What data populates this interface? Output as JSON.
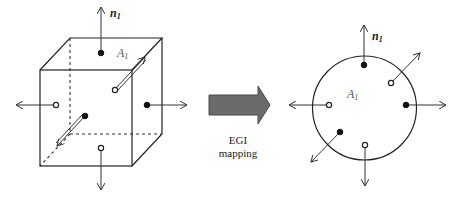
{
  "figure": {
    "left_panel": {
      "shape": "cube",
      "normal_label": "n",
      "normal_subscript": "1",
      "area_label": "A",
      "area_subscript": "1",
      "faces": [
        {
          "face": "top",
          "marker": "filled",
          "direction": "up"
        },
        {
          "face": "back",
          "marker": "open",
          "direction": "up-right"
        },
        {
          "face": "left",
          "marker": "open",
          "direction": "left"
        },
        {
          "face": "right",
          "marker": "filled",
          "direction": "right"
        },
        {
          "face": "front",
          "marker": "filled",
          "direction": "down-left"
        },
        {
          "face": "bottom",
          "marker": "open",
          "direction": "down"
        }
      ]
    },
    "mapping_arrow": {
      "caption_line1": "EGI",
      "caption_line2": "mapping",
      "color": "#6b6b6b"
    },
    "right_panel": {
      "shape": "unit-sphere-circle",
      "normal_label": "n",
      "normal_subscript": "1",
      "area_label": "A",
      "area_subscript": "1"
    }
  }
}
